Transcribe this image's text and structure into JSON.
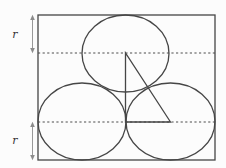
{
  "labels": {
    "top_radius": "r",
    "bottom_radius": "r"
  },
  "colors": {
    "background": "#fcfcfc",
    "line": "#464646",
    "dashed_line": "#4d4d4d",
    "arrow": "#8c8c8c",
    "label_text": "#343434"
  }
}
